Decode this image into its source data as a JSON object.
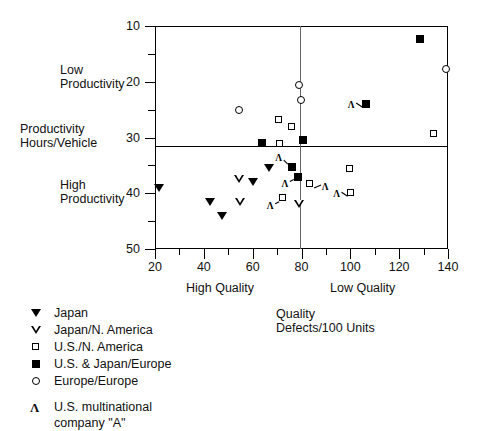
{
  "chart_data": {
    "type": "scatter",
    "title": "",
    "xlabel": "Quality",
    "xsublabel": "Defects/100 Units",
    "ylabel": "Productivity",
    "ysublabel": "Hours/Vehicle",
    "xlim": [
      20,
      140
    ],
    "ylim": [
      10,
      50
    ],
    "xticks": [
      20,
      40,
      60,
      80,
      100,
      120,
      140
    ],
    "xticks_minor": [
      30,
      50,
      70,
      90,
      110,
      130
    ],
    "yticks": [
      10,
      20,
      30,
      40,
      50
    ],
    "yticks_minor": [
      15,
      25,
      35,
      45
    ],
    "grid": false,
    "legend_position": "below-left",
    "quadrant_lines": {
      "horizontal_y": 28.5,
      "vertical_x": 80
    },
    "quadrant_labels": {
      "upper_left_y": "Low Productivity",
      "lower_left_y": "High Productivity",
      "lower_left_x": "High Quality",
      "lower_right_x": "Low Quality"
    },
    "series": [
      {
        "name": "Japan",
        "marker": "filled-down-triangle",
        "points": [
          {
            "x": 21.5,
            "y": 21.0
          },
          {
            "x": 42.5,
            "y": 18.5
          },
          {
            "x": 47.5,
            "y": 16.0
          },
          {
            "x": 60.0,
            "y": 22.0
          },
          {
            "x": 66.5,
            "y": 24.5
          }
        ]
      },
      {
        "name": "Japan/N. America",
        "marker": "open-down-triangle",
        "points": [
          {
            "x": 54.5,
            "y": 22.5
          },
          {
            "x": 55.0,
            "y": 18.5
          },
          {
            "x": 79.0,
            "y": 18.0
          }
        ]
      },
      {
        "name": "U.S./N. America",
        "marker": "open-square",
        "points": [
          {
            "x": 71.0,
            "y": 33.0
          },
          {
            "x": 71.5,
            "y": 28.8
          },
          {
            "x": 72.5,
            "y": 19.0
          },
          {
            "x": 76.5,
            "y": 31.8
          },
          {
            "x": 83.5,
            "y": 21.5
          },
          {
            "x": 100.0,
            "y": 24.2
          },
          {
            "x": 100.5,
            "y": 20.0
          },
          {
            "x": 134.5,
            "y": 30.5
          }
        ]
      },
      {
        "name": "U.S. & Japan/Europe",
        "marker": "filled-square",
        "points": [
          {
            "x": 64.0,
            "y": 29.0
          },
          {
            "x": 76.0,
            "y": 24.7
          },
          {
            "x": 78.5,
            "y": 23.0
          },
          {
            "x": 80.5,
            "y": 29.6
          },
          {
            "x": 106.5,
            "y": 36.0
          },
          {
            "x": 128.5,
            "y": 47.7
          }
        ]
      },
      {
        "name": "Europe/Europe",
        "marker": "open-circle",
        "points": [
          {
            "x": 54.5,
            "y": 34.8
          },
          {
            "x": 79.0,
            "y": 39.4
          },
          {
            "x": 80.0,
            "y": 36.6
          },
          {
            "x": 139.5,
            "y": 42.2
          }
        ]
      }
    ],
    "annotations": [
      {
        "label": "A",
        "target": {
          "x": 76.0,
          "y": 24.7
        },
        "direction": "upper-left"
      },
      {
        "label": "A",
        "target": {
          "x": 78.5,
          "y": 23.0
        },
        "direction": "lower-left"
      },
      {
        "label": "A",
        "target": {
          "x": 83.5,
          "y": 21.5
        },
        "direction": "right"
      },
      {
        "label": "A",
        "target": {
          "x": 72.5,
          "y": 19.0
        },
        "direction": "lower-left"
      },
      {
        "label": "A",
        "target": {
          "x": 100.5,
          "y": 20.0
        },
        "direction": "left"
      },
      {
        "label": "A",
        "target": {
          "x": 106.5,
          "y": 36.0
        },
        "direction": "left"
      }
    ]
  },
  "axis": {
    "y_title": "Productivity",
    "y_subtitle": "Hours/Vehicle",
    "x_title": "Quality",
    "x_subtitle": "Defects/100 Units",
    "low_productivity_line1": "Low",
    "low_productivity_line2": "Productivity",
    "high_productivity_line1": "High",
    "high_productivity_line2": "Productivity",
    "high_quality": "High Quality",
    "low_quality": "Low Quality",
    "ytick_labels": [
      "50",
      "40",
      "30",
      "20",
      "10"
    ],
    "xtick_labels": [
      "20",
      "40",
      "60",
      "80",
      "100",
      "120",
      "140"
    ]
  },
  "legend": {
    "items": [
      {
        "label": "Japan",
        "symbol": "filled-down-triangle"
      },
      {
        "label": "Japan/N. America",
        "symbol": "open-down-triangle"
      },
      {
        "label": "U.S./N. America",
        "symbol": "open-square"
      },
      {
        "label": "U.S. & Japan/Europe",
        "symbol": "filled-square"
      },
      {
        "label": "Europe/Europe",
        "symbol": "open-circle"
      }
    ],
    "annotation_item": {
      "symbol": "arrow",
      "label_line1": "U.S. multinational",
      "label_line2": "company \"A\""
    }
  }
}
